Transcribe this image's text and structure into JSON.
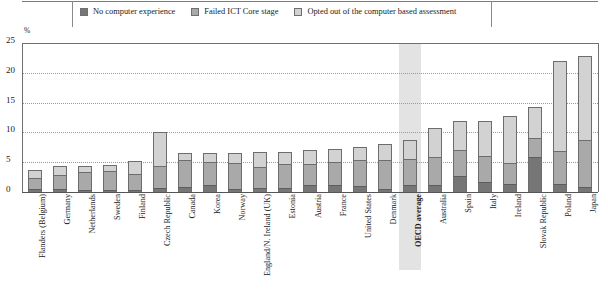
{
  "chart_data": {
    "type": "bar",
    "subtype": "stacked-vertical",
    "title": "",
    "xlabel": "",
    "ylabel": "%",
    "ylim": [
      0,
      25
    ],
    "yticks": [
      0,
      5,
      10,
      15,
      20,
      25
    ],
    "ytick_labels": [
      "0",
      "5",
      "10",
      "15",
      "20",
      "25"
    ],
    "grid": "horizontal-dotted",
    "legend_position": "top-center",
    "unit_label": "%",
    "highlight_category": "OECD average",
    "categories": [
      "Flanders (Belgium)",
      "Germany",
      "Netherlands",
      "Sweden",
      "Finland",
      "Czech Republic",
      "Canada",
      "Korea",
      "Norway",
      "England/N. Ireland (UK)",
      "Estonia",
      "Austria",
      "France",
      "United States",
      "Denmark",
      "OECD average",
      "Australia",
      "Spain",
      "Italy",
      "Ireland",
      "Slovak Republic",
      "Poland",
      "Japan"
    ],
    "series": [
      {
        "name": "No computer experience",
        "color": "#767676",
        "values": [
          0.5,
          0.5,
          0.4,
          0.4,
          0.4,
          0.6,
          0.9,
          1.1,
          0.5,
          0.6,
          0.6,
          1.1,
          1.2,
          1.0,
          0.5,
          1.1,
          1.2,
          2.7,
          1.7,
          1.3,
          5.9,
          1.4,
          0.8
        ]
      },
      {
        "name": "Failed ICT Core stage",
        "color": "#a9a9a9",
        "values": [
          1.8,
          2.4,
          3.0,
          3.1,
          2.7,
          3.8,
          4.4,
          4.0,
          4.4,
          3.6,
          4.1,
          3.6,
          3.9,
          4.3,
          4.8,
          4.5,
          4.7,
          4.3,
          4.4,
          3.5,
          3.2,
          5.4,
          7.9
        ]
      },
      {
        "name": "Opted out of the computer based assessment",
        "color": "#d2d2d2",
        "values": [
          1.4,
          1.5,
          1.0,
          1.0,
          2.1,
          5.6,
          1.2,
          1.5,
          1.7,
          2.5,
          2.0,
          2.3,
          2.1,
          2.2,
          2.8,
          3.2,
          4.9,
          5.0,
          5.9,
          8.0,
          5.2,
          15.2,
          14.1
        ]
      }
    ],
    "totals": [
      3.7,
      4.4,
      4.4,
      4.5,
      5.2,
      10.0,
      6.5,
      6.6,
      6.6,
      6.7,
      6.7,
      7.0,
      7.2,
      7.5,
      8.1,
      8.8,
      10.8,
      12.0,
      12.0,
      12.8,
      14.3,
      22.0,
      22.8
    ]
  },
  "legend": {
    "items": [
      {
        "label": "No computer experience",
        "color": "#767676"
      },
      {
        "label": "Failed ICT Core stage",
        "color": "#a9a9a9"
      },
      {
        "label": "Opted out of the computer based assessment",
        "color": "#d2d2d2"
      }
    ]
  }
}
